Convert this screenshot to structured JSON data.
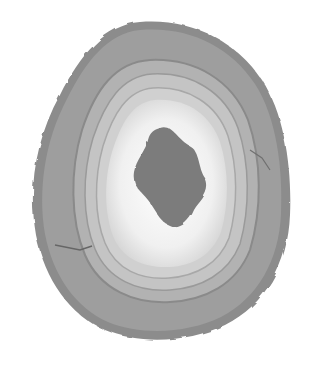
{
  "image": {
    "subject": "agate slice",
    "description": "Grayscale photograph of a polished banded agate cross-section with concentric bands and a dark crystalline core",
    "colors": {
      "background": "#ffffff",
      "outer_rind": "#8a8a8a",
      "outer_band": "#9c9c9c",
      "mid_band": "#b4b4b4",
      "inner_band": "#c8c8c8",
      "inner_white": "#f2f2f2",
      "core": "#7a7a7a"
    }
  }
}
